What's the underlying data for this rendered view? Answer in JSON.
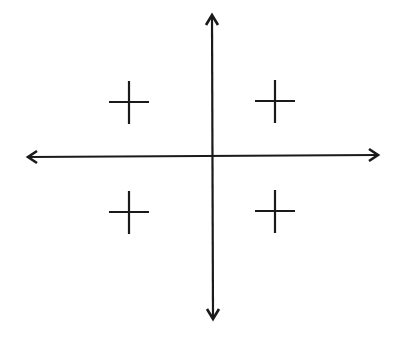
{
  "diagram": {
    "type": "coordinate-plane-quadrants",
    "stroke_color": "#1a1a1a",
    "background": "#ffffff",
    "axes": {
      "horizontal": {
        "x1": 27,
        "y1": 157,
        "x2": 379,
        "y2": 155
      },
      "vertical": {
        "x1": 212,
        "y1": 14,
        "x2": 213,
        "y2": 320
      }
    },
    "quadrant_signs": [
      {
        "quadrant": "II",
        "symbol": "+",
        "cx": 129,
        "cy": 102
      },
      {
        "quadrant": "I",
        "symbol": "+",
        "cx": 275,
        "cy": 102
      },
      {
        "quadrant": "III",
        "symbol": "+",
        "cx": 129,
        "cy": 212
      },
      {
        "quadrant": "IV",
        "symbol": "+",
        "cx": 275,
        "cy": 211
      }
    ]
  }
}
